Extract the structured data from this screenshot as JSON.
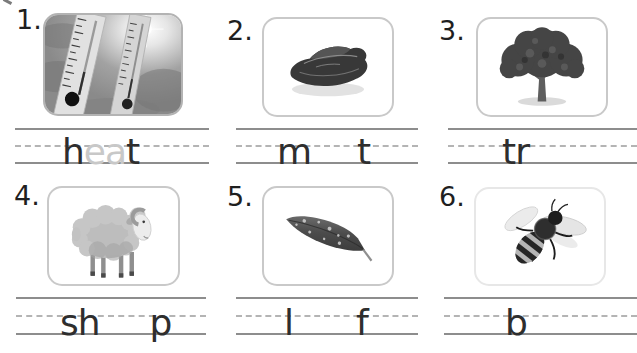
{
  "worksheet": {
    "line_style": "solid-dashed-solid handwriting guides",
    "colors": {
      "letter_dark": "#2e2e2e",
      "letter_trace": "#c8c8c8",
      "guide_line_solid": "#8d8d8d",
      "guide_line_dashed": "#b4b4b4",
      "card_border": "#c9c9c9"
    },
    "items": [
      {
        "number": "1.",
        "image": "thermometers-in-sunny-sky",
        "letters": [
          {
            "char": "h",
            "trace": false
          },
          {
            "char": "e",
            "trace": true
          },
          {
            "char": "a",
            "trace": true
          },
          {
            "char": "t",
            "trace": false
          }
        ]
      },
      {
        "number": "2.",
        "image": "piece-of-meat",
        "letters": [
          {
            "char": "m",
            "trace": false
          },
          {
            "char": "t",
            "trace": false
          }
        ]
      },
      {
        "number": "3.",
        "image": "tree",
        "letters": [
          {
            "char": "t",
            "trace": false
          },
          {
            "char": "r",
            "trace": false
          }
        ]
      },
      {
        "number": "4.",
        "image": "sheep-ram",
        "letters": [
          {
            "char": "s",
            "trace": false
          },
          {
            "char": "h",
            "trace": false
          },
          {
            "char": "p",
            "trace": false
          }
        ]
      },
      {
        "number": "5.",
        "image": "leaf",
        "letters": [
          {
            "char": "l",
            "trace": false
          },
          {
            "char": "f",
            "trace": false
          }
        ]
      },
      {
        "number": "6.",
        "image": "bee",
        "letters": [
          {
            "char": "b",
            "trace": false
          }
        ]
      }
    ]
  }
}
